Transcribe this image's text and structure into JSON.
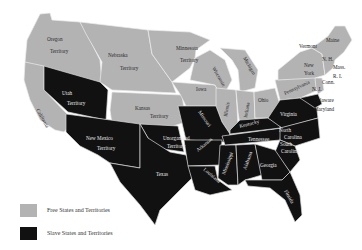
{
  "legend": {
    "free": {
      "label": "Free States and Territories",
      "color": "#b3b3b3"
    },
    "slave": {
      "label": "Slave States and Territories",
      "color": "#111111"
    }
  },
  "labels": {
    "oregon1": "Oregon",
    "oregon2": "Territory",
    "nebraska1": "Nebraska",
    "nebraska2": "Territory",
    "minnesota1": "Minnesota",
    "minnesota2": "Territory",
    "california": "California",
    "utah1": "Utah",
    "utah2": "Territory",
    "kansas1": "Kansas",
    "kansas2": "Territory",
    "newmexico1": "New Mexico",
    "newmexico2": "Territory",
    "unorg1": "Unorganized",
    "unorg2": "Territory",
    "texas": "Texas",
    "iowa": "Iowa",
    "wisconsin": "Wisconsin",
    "michigan": "Michigan",
    "illinois": "Illinois",
    "indiana": "Indiana",
    "ohio": "Ohio",
    "pennsylvania": "Pennsylvania",
    "newyork1": "New",
    "newyork2": "York",
    "vermont": "Vermont",
    "nh": "N. H.",
    "maine": "Maine",
    "mass": "Mass.",
    "ri": "R. I.",
    "conn": "Conn.",
    "nj": "N. J.",
    "delaware": "Delaware",
    "maryland": "Maryland",
    "missouri": "Missouri",
    "kentucky": "Kentucky",
    "virginia": "Virginia",
    "tennessee": "Tennessee",
    "nc1": "North",
    "nc2": "Carolina",
    "sc1": "South",
    "sc2": "Carolina",
    "arkansas": "Arkansas",
    "louisiana": "Louisiana",
    "mississippi": "Mississippi",
    "alabama": "Alabama",
    "georgia": "Georgia",
    "florida": "Florida"
  }
}
